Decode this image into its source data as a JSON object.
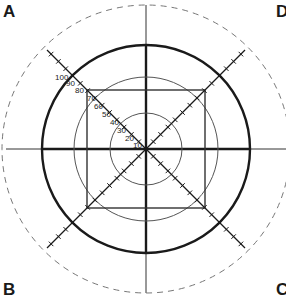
{
  "diagram": {
    "corner_labels": {
      "top_left": "A",
      "top_right": "D",
      "bottom_left": "B",
      "bottom_right": "C"
    },
    "center": [
      146,
      149
    ],
    "circles": [
      {
        "name": "outer-dashed",
        "r": 144,
        "style": "dashed"
      },
      {
        "name": "thick",
        "r": 104,
        "style": "thick"
      },
      {
        "name": "middle",
        "r": 72,
        "style": "thin"
      },
      {
        "name": "inner",
        "r": 36,
        "style": "thin"
      }
    ],
    "square_half_side": 59,
    "diagonal_extent": 99,
    "tick_step": 7.3,
    "scale_labels": [
      "100",
      "90",
      "80",
      "70",
      "60",
      "50",
      "40",
      "30",
      "20",
      "10"
    ],
    "colors": {
      "line": "#1a1a1a",
      "thin": "#555555",
      "dashed": "#777777"
    }
  }
}
